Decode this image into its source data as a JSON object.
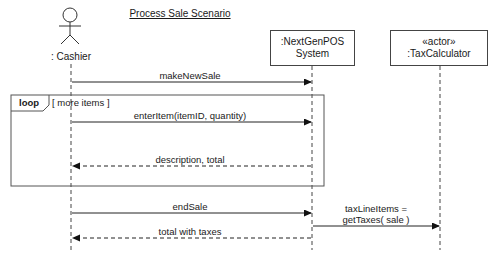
{
  "diagram": {
    "title": "Process Sale Scenario",
    "type": "UML sequence diagram",
    "participants": [
      {
        "id": "cashier",
        "label": ": Cashier",
        "kind": "actor"
      },
      {
        "id": "system",
        "label_line1": ":NextGenPOS",
        "label_line2": "System",
        "kind": "object"
      },
      {
        "id": "tax",
        "label_line1": "«actor»",
        "label_line2": ":TaxCalculator",
        "kind": "object"
      }
    ],
    "messages": [
      {
        "label": "makeNewSale",
        "from": "cashier",
        "to": "system",
        "style": "sync"
      },
      {
        "label": "enterItem(itemID, quantity)",
        "from": "cashier",
        "to": "system",
        "style": "sync"
      },
      {
        "label": "description, total",
        "from": "system",
        "to": "cashier",
        "style": "return"
      },
      {
        "label": "endSale",
        "from": "cashier",
        "to": "system",
        "style": "sync"
      },
      {
        "label_line1": "taxLineItems =",
        "label_line2": "getTaxes( sale )",
        "from": "system",
        "to": "tax",
        "style": "sync"
      },
      {
        "label": "total with taxes",
        "from": "system",
        "to": "cashier",
        "style": "return"
      }
    ],
    "fragment": {
      "operator": "loop",
      "guard": "[ more items ]"
    }
  }
}
